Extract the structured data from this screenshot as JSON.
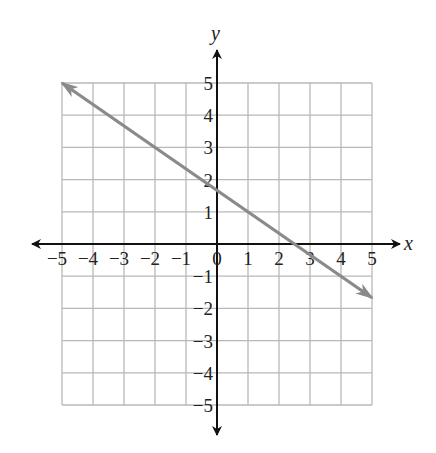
{
  "chart_data": {
    "type": "line",
    "title": "",
    "xlabel": "x",
    "ylabel": "y",
    "xlim": [
      -5,
      5
    ],
    "ylim": [
      -5,
      5
    ],
    "grid": true,
    "x_ticks": [
      "-5",
      "-4",
      "-3",
      "-2",
      "-1",
      "0",
      "1",
      "2",
      "3",
      "4",
      "5"
    ],
    "y_ticks": [
      "5",
      "4",
      "3",
      "2",
      "1",
      "-1",
      "-2",
      "-3",
      "-4",
      "-5"
    ],
    "series": [
      {
        "name": "line",
        "equation": "y = -2/3 x + 5/3",
        "x": [
          -5,
          5
        ],
        "y": [
          5,
          -1.67
        ],
        "color": "#8a8a8a",
        "arrows": "both"
      }
    ],
    "annotations": []
  },
  "axes": {
    "x_label": "x",
    "y_label": "y",
    "origin_label": "0"
  },
  "colors": {
    "grid": "#b8b8b8",
    "axis": "#111111",
    "line": "#8a8a8a"
  }
}
